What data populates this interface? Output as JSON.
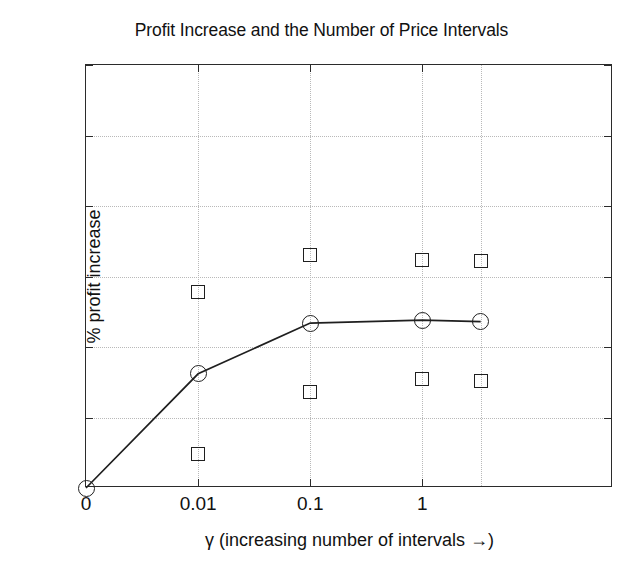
{
  "figure": {
    "background_color": "#ffffff",
    "axis_color": "#2b2b2b",
    "grid_color": "#b9b9b9",
    "marker_color": "#1f1f1f"
  },
  "chart_data": {
    "type": "line",
    "title": "Profit Increase and the Number of Price Intervals",
    "xlabel": "γ (increasing number of intervals →)",
    "ylabel": "% profit increase",
    "grid": true,
    "legend": null,
    "xlim": [
      0,
      4.7
    ],
    "ylim": [
      0,
      30
    ],
    "yticks": [
      0,
      5,
      10,
      15,
      20,
      25,
      30
    ],
    "ytick_labels": [
      "0",
      "5",
      "10",
      "15",
      "20",
      "25",
      "30"
    ],
    "xticks": [
      0,
      1,
      2,
      3
    ],
    "xtick_labels": [
      "0",
      "0.01",
      "0.1",
      "1"
    ],
    "x_positions": [
      0,
      1,
      2,
      3,
      3.52
    ],
    "series": [
      {
        "name": "mean % profit increase",
        "marker": "circle",
        "line": "solid",
        "values": [
          0.0,
          8.1,
          11.7,
          11.9,
          11.8
        ]
      },
      {
        "name": "upper bound",
        "marker": "square",
        "line": "none",
        "values": [
          null,
          13.9,
          16.5,
          16.2,
          16.1
        ]
      },
      {
        "name": "lower bound",
        "marker": "square",
        "line": "none",
        "values": [
          null,
          2.4,
          6.8,
          7.7,
          7.6
        ]
      }
    ]
  }
}
